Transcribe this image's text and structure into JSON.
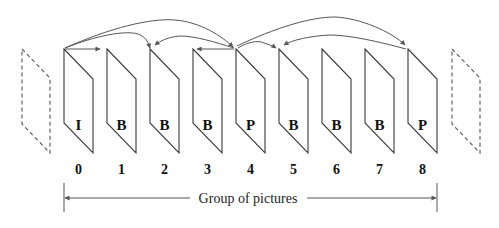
{
  "diagram": {
    "frames": [
      {
        "index": "0",
        "type": "I"
      },
      {
        "index": "1",
        "type": "B"
      },
      {
        "index": "2",
        "type": "B"
      },
      {
        "index": "3",
        "type": "B"
      },
      {
        "index": "4",
        "type": "P"
      },
      {
        "index": "5",
        "type": "B"
      },
      {
        "index": "6",
        "type": "B"
      },
      {
        "index": "7",
        "type": "B"
      },
      {
        "index": "8",
        "type": "P"
      }
    ],
    "ghost_frames": [
      "previous-gop-frame",
      "next-gop-frame"
    ],
    "references": [
      {
        "from": "0",
        "to": "1"
      },
      {
        "from": "0",
        "to": "2"
      },
      {
        "from": "0",
        "to": "4"
      },
      {
        "from": "4",
        "to": "2"
      },
      {
        "from": "4",
        "to": "3"
      },
      {
        "from": "4",
        "to": "5"
      },
      {
        "from": "4",
        "to": "8"
      },
      {
        "from": "8",
        "to": "5"
      }
    ],
    "gop_label": "Group of pictures",
    "colors": {
      "stroke": "#3a3a3a",
      "arrow": "#555555",
      "text": "#111111",
      "background": "#ffffff"
    }
  }
}
